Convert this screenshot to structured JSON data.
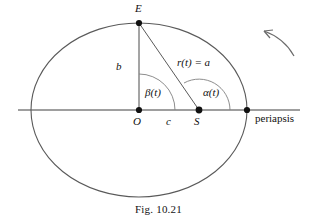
{
  "figure": {
    "caption": "Fig. 10.21",
    "colors": {
      "ink": "#1a1a1a",
      "curve": "#555555",
      "arc": "#777777",
      "axis": "#444444",
      "background": "#ffffff"
    }
  },
  "labels": {
    "apex_point": "E",
    "center_point": "O",
    "focus_point": "S",
    "semi_minor": "b",
    "focal_distance": "c",
    "radius": "r(t) = a",
    "center_angle": "β(t)",
    "focus_angle": "α(t)",
    "periapsis": "periapsis"
  },
  "geometry": {
    "ellipse_center": {
      "x": 139,
      "y": 110
    },
    "semi_major_a": 108,
    "semi_minor_b": 87,
    "apex_E": {
      "x": 139,
      "y": 23
    },
    "center_O": {
      "x": 139,
      "y": 110
    },
    "focus_S": {
      "x": 199,
      "y": 110
    },
    "periapsis_point": {
      "x": 247,
      "y": 110
    },
    "axis_line": {
      "x1": 18,
      "y1": 110,
      "x2": 300,
      "y2": 110
    },
    "beta_arc_radius": 36,
    "alpha_arc_radius": 31,
    "direction_arrow": "counterclockwise"
  },
  "label_positions": {
    "apex_point": {
      "x": 135,
      "y": 4
    },
    "center_point": {
      "x": 133,
      "y": 117
    },
    "focus_point": {
      "x": 194,
      "y": 117
    },
    "semi_minor": {
      "x": 116,
      "y": 61
    },
    "focal_distance": {
      "x": 166,
      "y": 117
    },
    "radius": {
      "x": 178,
      "y": 58
    },
    "center_angle": {
      "x": 145,
      "y": 88
    },
    "focus_angle": {
      "x": 203,
      "y": 88
    },
    "periapsis": {
      "x": 255,
      "y": 113
    }
  }
}
